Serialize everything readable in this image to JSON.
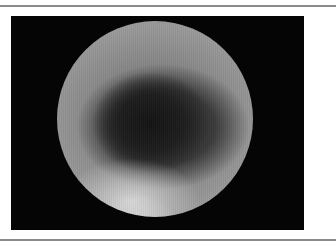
{
  "figure": {
    "colors": {
      "frame_background": "#050505",
      "rule": "#8a8a8a",
      "page_background": "#ffffff"
    }
  }
}
